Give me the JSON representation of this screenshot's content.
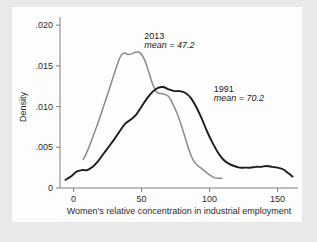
{
  "chart_data": {
    "type": "line",
    "title": "",
    "subtitle": "",
    "xlabel": "Women's relative concentration in industrial employment",
    "ylabel": "Density",
    "xlim": [
      -10,
      165
    ],
    "ylim": [
      0,
      0.021
    ],
    "grid": false,
    "legend_position": "inline-annotations",
    "xticks": [
      0,
      50,
      100,
      150
    ],
    "xtick_labels": [
      "0",
      "50",
      "100",
      "150"
    ],
    "yticks": [
      0,
      0.005,
      0.01,
      0.015,
      0.02
    ],
    "ytick_labels": [
      "0",
      ".005",
      ".010",
      ".015",
      ".020"
    ],
    "series": [
      {
        "name": "2013",
        "color": "#8a8a8a",
        "mean": 47.2,
        "annotation_label": "2013",
        "annotation_mean": "mean = 47.2",
        "x": [
          7,
          10,
          14,
          18,
          22,
          26,
          30,
          34,
          37,
          40,
          43,
          46,
          49,
          52,
          55,
          58,
          61,
          64,
          67,
          70,
          73,
          76,
          79,
          82,
          85,
          88,
          91,
          94,
          97,
          100,
          103,
          106,
          109
        ],
        "y": [
          0.0035,
          0.0045,
          0.0062,
          0.008,
          0.01,
          0.012,
          0.0141,
          0.016,
          0.0166,
          0.0164,
          0.0165,
          0.0167,
          0.0166,
          0.0158,
          0.0144,
          0.0128,
          0.0118,
          0.0116,
          0.0115,
          0.0112,
          0.0103,
          0.0092,
          0.0078,
          0.0062,
          0.0046,
          0.0034,
          0.0028,
          0.0024,
          0.002,
          0.0016,
          0.0013,
          0.0012,
          0.0012
        ]
      },
      {
        "name": "1991",
        "color": "#1c1c1c",
        "mean": 70.2,
        "annotation_label": "1991",
        "annotation_mean": "mean = 70.2",
        "x": [
          -6,
          -2,
          2,
          6,
          10,
          14,
          18,
          22,
          26,
          30,
          34,
          38,
          42,
          46,
          50,
          54,
          58,
          62,
          66,
          70,
          74,
          78,
          82,
          86,
          90,
          94,
          98,
          102,
          106,
          110,
          114,
          118,
          122,
          126,
          130,
          134,
          138,
          142,
          146,
          150,
          154,
          158,
          161
        ],
        "y": [
          0.001,
          0.0014,
          0.002,
          0.0022,
          0.0022,
          0.0026,
          0.0033,
          0.0042,
          0.0051,
          0.006,
          0.007,
          0.0079,
          0.0084,
          0.009,
          0.01,
          0.011,
          0.0118,
          0.0123,
          0.0124,
          0.0121,
          0.0119,
          0.0119,
          0.0117,
          0.0111,
          0.01,
          0.0086,
          0.007,
          0.0056,
          0.0044,
          0.0035,
          0.003,
          0.0027,
          0.0025,
          0.0025,
          0.0025,
          0.0026,
          0.0026,
          0.0027,
          0.0026,
          0.0025,
          0.0023,
          0.0018,
          0.0014
        ]
      }
    ],
    "annotations": [
      {
        "text": "2013",
        "x": 52,
        "y": 0.0183
      },
      {
        "text": "mean = 47.2",
        "x": 52,
        "y": 0.0172
      },
      {
        "text": "1991",
        "x": 103,
        "y": 0.0118
      },
      {
        "text": "mean = 70.2",
        "x": 103,
        "y": 0.0107
      }
    ]
  },
  "colors": {
    "background": "#e9e9e9",
    "panel": "#fdfdfd",
    "axis": "#6f6f6f",
    "text": "#2b2b2b",
    "series_2013": "#8a8a8a",
    "series_1991": "#1c1c1c"
  }
}
